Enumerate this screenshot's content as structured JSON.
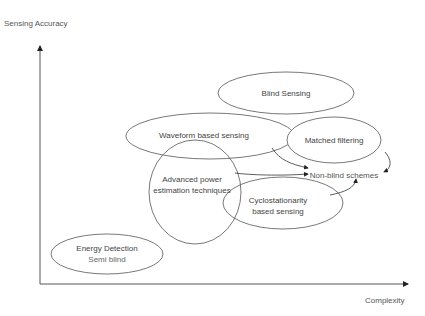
{
  "axes": {
    "y_label": "Sensing Accuracy",
    "x_label": "Complexity"
  },
  "nodes": {
    "blind_sensing": "Blind Sensing",
    "waveform": "Waveform based sensing",
    "matched": "Matched filtering",
    "non_blind": "Non-blind schemes",
    "advanced_line1": "Advanced power",
    "advanced_line2": "estimation techniques",
    "cyclo_line1": "Cyclostationarity",
    "cyclo_line2": "based sensing",
    "energy_line1": "Energy Detection",
    "energy_line2": "Semi blind"
  },
  "colors": {
    "stroke": "#555555",
    "text": "#444444",
    "background": "#ffffff"
  }
}
